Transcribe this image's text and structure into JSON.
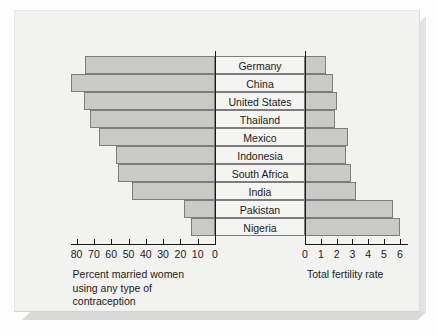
{
  "chart_data": {
    "type": "bar",
    "title": "",
    "subtitle": "",
    "orientation": "horizontal",
    "layout": "back-to-back bidirectional bar chart (population pyramid style) with centered country label column",
    "categories": [
      "Germany",
      "China",
      "United States",
      "Thailand",
      "Mexico",
      "Indonesia",
      "South Africa",
      "India",
      "Pakistan",
      "Nigeria"
    ],
    "series": [
      {
        "name": "Percent married women using any type of contraception",
        "side": "left",
        "axis_label": "Percent married women\nusing any type of\ncontraception",
        "unit": "percent",
        "values": [
          75,
          83,
          76,
          72,
          67,
          57,
          56,
          48,
          18,
          14
        ],
        "axis_direction": "reversed",
        "ticks": [
          80,
          70,
          60,
          50,
          40,
          30,
          20,
          10,
          0
        ],
        "tick_labels": [
          "80",
          "70",
          "60",
          "50",
          "40",
          "30",
          "20",
          "10",
          "0"
        ],
        "xlim": [
          0,
          86
        ],
        "grid": false
      },
      {
        "name": "Total fertility rate",
        "side": "right",
        "axis_label": "Total fertility rate",
        "unit": "births per woman",
        "values": [
          1.3,
          1.8,
          2.0,
          1.9,
          2.7,
          2.6,
          2.9,
          3.2,
          5.6,
          6.0
        ],
        "axis_direction": "normal",
        "ticks": [
          0,
          1,
          2,
          3,
          4,
          5,
          6
        ],
        "tick_labels": [
          "0",
          "1",
          "2",
          "3",
          "4",
          "5",
          "6"
        ],
        "xlim": [
          0,
          6.4
        ],
        "grid": false
      }
    ],
    "legend": null,
    "legend_position": "none",
    "colors": {
      "bar_fill": "#c9c9c7",
      "bar_stroke": "#7d7d7d",
      "axis": "#1a1a1a",
      "text": "#1a1a1a",
      "panel_background": "#f2f2f0",
      "label_cell_background": "#f4f4f2"
    }
  },
  "left_axis": {
    "caption": "Percent married women\nusing any type of\ncontraception"
  },
  "right_axis": {
    "caption": "Total fertility rate"
  }
}
